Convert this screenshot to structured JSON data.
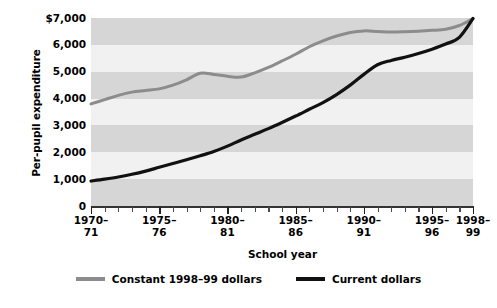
{
  "chart_data": {
    "type": "line",
    "title": "",
    "xlabel": "School year",
    "ylabel": "Per-pupil expenditure",
    "ylim": [
      0,
      7000
    ],
    "ytick_labels": [
      "$7,000",
      "6,000",
      "5,000",
      "4,000",
      "3,000",
      "2,000",
      "1,000",
      "0"
    ],
    "ytick_values": [
      7000,
      6000,
      5000,
      4000,
      3000,
      2000,
      1000,
      0
    ],
    "xtick_labels": [
      "1970–\n71",
      "1975–\n76",
      "1980–\n81",
      "1985–\n86",
      "1990–\n91",
      "1995–\n96",
      "1998–\n99"
    ],
    "xtick_values": [
      1970,
      1975,
      1980,
      1985,
      1990,
      1995,
      1998
    ],
    "x": [
      1970,
      1971,
      1972,
      1973,
      1974,
      1975,
      1976,
      1977,
      1978,
      1979,
      1980,
      1981,
      1982,
      1983,
      1984,
      1985,
      1986,
      1987,
      1988,
      1989,
      1990,
      1991,
      1992,
      1993,
      1994,
      1995,
      1996,
      1997,
      1998
    ],
    "grid": "horizontal-bands",
    "legend_position": "below",
    "series": [
      {
        "name": "Constant 1998–99 dollars",
        "color": "#8c8c8c",
        "values": [
          3800,
          3960,
          4120,
          4240,
          4300,
          4360,
          4500,
          4700,
          4940,
          4900,
          4830,
          4800,
          4960,
          5160,
          5400,
          5650,
          5930,
          6150,
          6330,
          6460,
          6520,
          6500,
          6480,
          6490,
          6510,
          6540,
          6580,
          6720,
          6980
        ]
      },
      {
        "name": "Current dollars",
        "color": "#111111",
        "values": [
          930,
          1000,
          1080,
          1180,
          1300,
          1440,
          1580,
          1720,
          1870,
          2030,
          2230,
          2460,
          2670,
          2880,
          3110,
          3350,
          3600,
          3850,
          4150,
          4500,
          4900,
          5260,
          5420,
          5540,
          5680,
          5840,
          6030,
          6280,
          6980
        ]
      }
    ]
  },
  "axes": {
    "y_title": "Per-pupil expenditure",
    "x_title": "School year"
  },
  "legend": {
    "items": [
      {
        "label": "Constant 1998–99 dollars",
        "color": "#8c8c8c"
      },
      {
        "label": "Current dollars",
        "color": "#111111"
      }
    ]
  }
}
